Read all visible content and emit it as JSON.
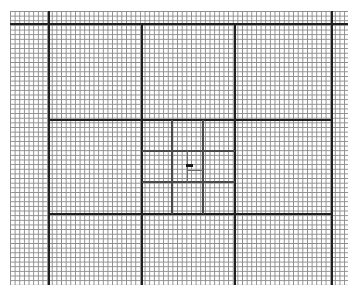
{
  "canvas": {
    "width": 357,
    "height": 295,
    "background": "#ffffff"
  },
  "grid": {
    "left": 10,
    "top": 11,
    "right": 348,
    "bottom": 285,
    "minor_pitch": 4.65,
    "colors": {
      "minor": "#8c8c8c",
      "medium": "#4a4a4a",
      "fine": "#6e6e6e",
      "major": "#1f1f1f",
      "mark": "#1a1a1a"
    },
    "widths": {
      "major": 2,
      "medium": 1.5,
      "fine": 1
    }
  },
  "lines": {
    "major": [
      {
        "orient": "h",
        "pos": 24,
        "from": 10,
        "to": 348
      },
      {
        "orient": "v",
        "pos": 49,
        "from": 11,
        "to": 285
      },
      {
        "orient": "v",
        "pos": 332,
        "from": 11,
        "to": 285
      },
      {
        "orient": "h",
        "pos": 120,
        "from": 49,
        "to": 332
      },
      {
        "orient": "h",
        "pos": 214,
        "from": 49,
        "to": 332
      },
      {
        "orient": "v",
        "pos": 142,
        "from": 24,
        "to": 285
      },
      {
        "orient": "v",
        "pos": 235,
        "from": 24,
        "to": 285
      }
    ],
    "medium": [
      {
        "orient": "v",
        "pos": 172,
        "from": 120,
        "to": 214
      },
      {
        "orient": "v",
        "pos": 203,
        "from": 120,
        "to": 214
      },
      {
        "orient": "h",
        "pos": 151,
        "from": 142,
        "to": 235
      },
      {
        "orient": "h",
        "pos": 182,
        "from": 142,
        "to": 235
      }
    ],
    "fine": [
      {
        "orient": "v",
        "pos": 187,
        "from": 151,
        "to": 182
      },
      {
        "orient": "h",
        "pos": 170,
        "from": 187,
        "to": 203
      }
    ]
  },
  "center_mark": {
    "x": 186,
    "y": 164,
    "width": 7,
    "height": 3
  }
}
